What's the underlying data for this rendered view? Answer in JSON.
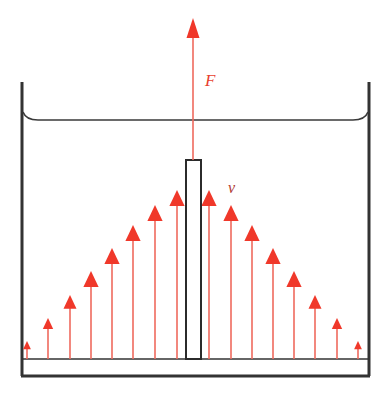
{
  "figure": {
    "type": "physics-diagram",
    "width": 392,
    "height": 402,
    "background": "#ffffff"
  },
  "colors": {
    "arrow_red": "#f0382a",
    "arrow_stem": "#ef6a5e",
    "label_force": "#e8412f",
    "label_velocity": "#b03a34",
    "container_outline": "#333333",
    "plate_outline": "#2b2b2b",
    "plate_fill": "#ffffff",
    "surface_line": "#3a3a3a"
  },
  "labels": [
    {
      "id": "force-label",
      "text": "F",
      "meaning": "applied force pulling plate upward",
      "x": 205,
      "y": 88,
      "color": "#e8412f",
      "size": 17,
      "italic": true
    },
    {
      "id": "velocity-label",
      "text": "v",
      "meaning": "fluid velocity profile",
      "x": 228,
      "y": 195,
      "color": "#b03a34",
      "size": 16,
      "italic": true
    }
  ],
  "container": {
    "name": "liquid-container",
    "left_wall_x": 22,
    "right_wall_x": 369,
    "top_y": 82,
    "inner_bottom_y": 359,
    "outer_bottom_y": 376,
    "wall_thickness": 3,
    "surface_line_y": 120,
    "surface_meniscus": true
  },
  "plate": {
    "name": "vertical-plate",
    "x": 186,
    "y": 160,
    "width": 15,
    "height": 199,
    "fill": "#ffffff",
    "stroke": "#2b2b2b",
    "stroke_width": 2
  },
  "force_arrow": {
    "name": "force-arrow",
    "x": 193,
    "tip_y": 18,
    "tail_y": 160,
    "head_width": 13,
    "head_height": 20,
    "color": "#f0382a"
  },
  "chart_data": {
    "type": "bar",
    "xlabel": "horizontal position across container",
    "ylabel": "fluid velocity (arrow length)",
    "baseline_y": 359,
    "categories": [
      "w1",
      "w2",
      "w3",
      "w4",
      "w5",
      "w6",
      "w7",
      "w8",
      "e1",
      "e2",
      "e3",
      "e4",
      "e5",
      "e6",
      "e7",
      "e8"
    ],
    "arrows": [
      {
        "x": 27,
        "tip_y": 341,
        "length": 18
      },
      {
        "x": 48,
        "tip_y": 318,
        "length": 41
      },
      {
        "x": 70,
        "tip_y": 295,
        "length": 64
      },
      {
        "x": 91,
        "tip_y": 271,
        "length": 88
      },
      {
        "x": 112,
        "tip_y": 248,
        "length": 111
      },
      {
        "x": 133,
        "tip_y": 225,
        "length": 134
      },
      {
        "x": 155,
        "tip_y": 205,
        "length": 154
      },
      {
        "x": 177,
        "tip_y": 190,
        "length": 169
      },
      {
        "x": 209,
        "tip_y": 190,
        "length": 169
      },
      {
        "x": 231,
        "tip_y": 205,
        "length": 154
      },
      {
        "x": 252,
        "tip_y": 225,
        "length": 134
      },
      {
        "x": 273,
        "tip_y": 248,
        "length": 111
      },
      {
        "x": 294,
        "tip_y": 271,
        "length": 88
      },
      {
        "x": 315,
        "tip_y": 295,
        "length": 64
      },
      {
        "x": 337,
        "tip_y": 318,
        "length": 41
      },
      {
        "x": 358,
        "tip_y": 341,
        "length": 18
      }
    ],
    "values": [
      18,
      41,
      64,
      88,
      111,
      134,
      154,
      169,
      169,
      154,
      134,
      111,
      88,
      64,
      41,
      18
    ],
    "ylim": [
      0,
      180
    ],
    "grid": false,
    "legend": false
  }
}
